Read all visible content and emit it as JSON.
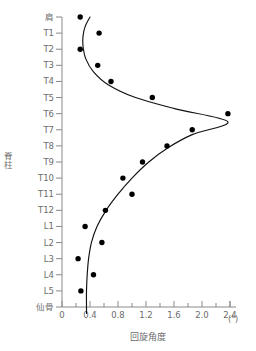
{
  "chart_data": {
    "type": "scatter",
    "title": "",
    "xlabel": "回旋角度",
    "xunit": "(°)",
    "ylabel": "脊柱",
    "xlim": [
      0,
      2.4
    ],
    "ylim_categories_top_to_bottom": true,
    "grid": false,
    "legend": null,
    "xticks": [
      0,
      0.4,
      0.8,
      1.2,
      1.6,
      2.0,
      2.4
    ],
    "xtick_labels": [
      "0",
      "0.4",
      "0.8",
      "1.2",
      "1.6",
      "2.0",
      "2.4"
    ],
    "xminor_step": 0.2,
    "categories": [
      "肩",
      "T1",
      "T2",
      "T3",
      "T4",
      "T5",
      "T6",
      "T7",
      "T8",
      "T9",
      "T10",
      "T11",
      "T12",
      "L1",
      "L2",
      "L3",
      "L4",
      "L5",
      "仙骨"
    ],
    "series": [
      {
        "name": "回旋角度",
        "marker": "filled-circle",
        "values": [
          0.26,
          0.53,
          0.26,
          0.51,
          0.7,
          1.29,
          2.37,
          1.86,
          1.5,
          1.15,
          0.87,
          1.0,
          0.62,
          0.33,
          0.57,
          0.23,
          0.45,
          0.27,
          null
        ]
      }
    ],
    "fitted_curve": {
      "name": "fitted-curve",
      "x": [
        0.4,
        0.33,
        0.3,
        0.3,
        0.34,
        0.45,
        0.66,
        1.05,
        1.62,
        2.37,
        1.86,
        1.52,
        1.24,
        1.0,
        0.8,
        0.63,
        0.5,
        0.42,
        0.38,
        0.36,
        0.35,
        0.35,
        0.35
      ],
      "y_levels": [
        0.0,
        0.6,
        1.2,
        1.8,
        2.6,
        3.4,
        4.2,
        5.0,
        5.7,
        6.5,
        7.3,
        8.1,
        9.0,
        10.0,
        11.0,
        12.0,
        13.0,
        14.0,
        15.0,
        16.0,
        17.0,
        18.0,
        18.4
      ]
    },
    "colors": {
      "marker": "#000000",
      "curve": "#111111",
      "axis": "#8a8a8a",
      "text": "#6b6b6b",
      "background": "#ffffff"
    }
  }
}
